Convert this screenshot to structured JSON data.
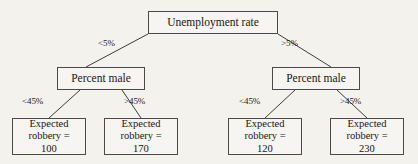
{
  "diagram": {
    "type": "decision-tree",
    "root": {
      "label": "Unemployment rate",
      "x": 148,
      "y": 11,
      "w": 130,
      "h": 23
    },
    "internal_nodes": [
      {
        "label": "Percent male",
        "x": 57,
        "y": 67,
        "w": 88,
        "h": 23
      },
      {
        "label": "Percent male",
        "x": 272,
        "y": 67,
        "w": 88,
        "h": 23
      }
    ],
    "leaves": [
      {
        "line1": "Expected",
        "line2": "robbery =",
        "line3": "100",
        "x": 12,
        "y": 118,
        "w": 74,
        "h": 37
      },
      {
        "line1": "Expected",
        "line2": "robbery =",
        "line3": "170",
        "x": 104,
        "y": 118,
        "w": 74,
        "h": 37
      },
      {
        "line1": "Expected",
        "line2": "robbery =",
        "line3": "120",
        "x": 228,
        "y": 118,
        "w": 74,
        "h": 37
      },
      {
        "line1": "Expected",
        "line2": "robbery =",
        "line3": "230",
        "x": 330,
        "y": 118,
        "w": 74,
        "h": 37
      }
    ],
    "edge_labels": [
      {
        "text": "<5%",
        "x": 98,
        "y": 38
      },
      {
        "text": ">5%",
        "x": 281,
        "y": 38
      },
      {
        "text": "<45%",
        "x": 22,
        "y": 96
      },
      {
        "text": ">45%",
        "x": 124,
        "y": 96
      },
      {
        "text": "<45%",
        "x": 239,
        "y": 96
      },
      {
        "text": ">45%",
        "x": 340,
        "y": 96
      }
    ],
    "edges": [
      {
        "from": "root",
        "to": "percent-male-left",
        "x1": 148,
        "y1": 34,
        "x2": 86,
        "y2": 67
      },
      {
        "from": "root",
        "to": "percent-male-right",
        "x1": 278,
        "y1": 34,
        "x2": 331,
        "y2": 67
      },
      {
        "from": "percent-male-left",
        "to": "leaf-100",
        "x1": 80,
        "y1": 90,
        "x2": 49,
        "y2": 118
      },
      {
        "from": "percent-male-left",
        "to": "leaf-170",
        "x1": 122,
        "y1": 90,
        "x2": 141,
        "y2": 118
      },
      {
        "from": "percent-male-right",
        "to": "leaf-120",
        "x1": 295,
        "y1": 90,
        "x2": 265,
        "y2": 118
      },
      {
        "from": "percent-male-right",
        "to": "leaf-230",
        "x1": 337,
        "y1": 90,
        "x2": 367,
        "y2": 118
      }
    ],
    "colors": {
      "background": "#f4f2ed",
      "box_border": "#4a4a4a",
      "box_fill": "#f7f5f1",
      "line": "#3d3d3d",
      "text": "#161616"
    }
  }
}
